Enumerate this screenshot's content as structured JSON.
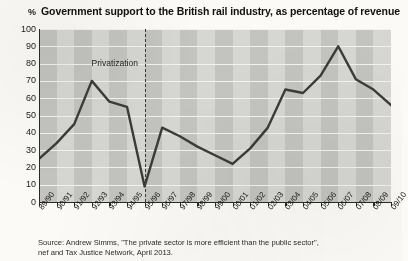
{
  "header": {
    "percent_symbol": "%",
    "title": "Government support to the British rail industry, as percentage of revenue"
  },
  "annotation": {
    "privatization_label": "Privatization",
    "privatization_at": "95/96"
  },
  "source": {
    "line1": "Source: Andrew Simms, \"The private sector is more efficient than the public sector\",",
    "line2": "nef and Tax Justice Network, April 2013."
  },
  "colors": {
    "line": "#3b3b3b",
    "plot_band_dark": "#c3c3bf",
    "plot_band_light": "#d6d6d2",
    "gridline": "#f2f2ee",
    "axis": "#2a2a2a",
    "paper": "#fbfaf7"
  },
  "chart_data": {
    "type": "line",
    "title": "Government support to the British rail industry, as percentage of revenue",
    "xlabel": "",
    "ylabel": "%",
    "ylim": [
      0,
      100
    ],
    "ytick_step": 10,
    "yticks": [
      0,
      10,
      20,
      30,
      40,
      50,
      60,
      70,
      80,
      90,
      100
    ],
    "grid": true,
    "legend": "none",
    "categories": [
      "89/90",
      "90/91",
      "91/92",
      "92/93",
      "93/94",
      "94/95",
      "95/96",
      "96/97",
      "97/98",
      "98/99",
      "99/00",
      "00/01",
      "01/02",
      "02/03",
      "03/04",
      "04/05",
      "05/06",
      "06/07",
      "07/08",
      "08/09",
      "09/10"
    ],
    "values": [
      25,
      34,
      45,
      70,
      58,
      55,
      9,
      43,
      38,
      32,
      27,
      22,
      31,
      43,
      65,
      63,
      73,
      90,
      71,
      65,
      56
    ],
    "annotations": [
      {
        "text": "Privatization",
        "x": "95/96",
        "style": "dashed-vertical-line"
      }
    ]
  }
}
